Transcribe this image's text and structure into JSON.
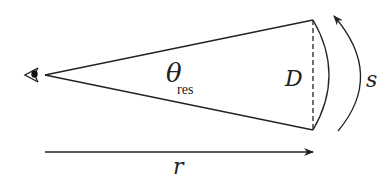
{
  "diagram": {
    "labels": {
      "theta": "θ",
      "theta_sub": "res",
      "diameter": "D",
      "arc_length": "s",
      "distance": "r"
    },
    "icons": {
      "observer": "eye-icon"
    },
    "colors": {
      "stroke": "#222222",
      "background": "#ffffff"
    }
  }
}
